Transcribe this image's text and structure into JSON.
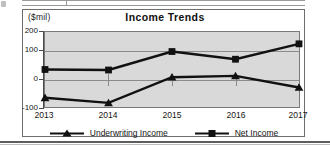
{
  "chart_data": {
    "type": "line",
    "title": "Income Trends",
    "xlabel": "",
    "ylabel": "($mil)",
    "unit_label": "($mil)",
    "categories": [
      "2013",
      "2014",
      "2015",
      "2016",
      "2017"
    ],
    "x": [
      2013,
      2014,
      2015,
      2016,
      2017
    ],
    "ylim": [
      -100,
      200
    ],
    "yticks": [
      200,
      100,
      0,
      -100
    ],
    "ytick_labels": [
      "200",
      "100",
      "0",
      "-100"
    ],
    "grid": true,
    "legend_position": "bottom",
    "plot_background": "#d9d9d9",
    "series": [
      {
        "name": "Underwriting Income",
        "marker": "triangle",
        "color": "#111111",
        "values": [
          -60,
          -80,
          20,
          25,
          -20
        ]
      },
      {
        "name": "Net Income",
        "marker": "square",
        "color": "#111111",
        "values": [
          50,
          48,
          120,
          90,
          150
        ]
      }
    ]
  },
  "legend": {
    "entries": [
      {
        "label": "Underwriting Income",
        "marker": "triangle-marker-icon"
      },
      {
        "label": "Net Income",
        "marker": "square-marker-icon"
      }
    ]
  }
}
